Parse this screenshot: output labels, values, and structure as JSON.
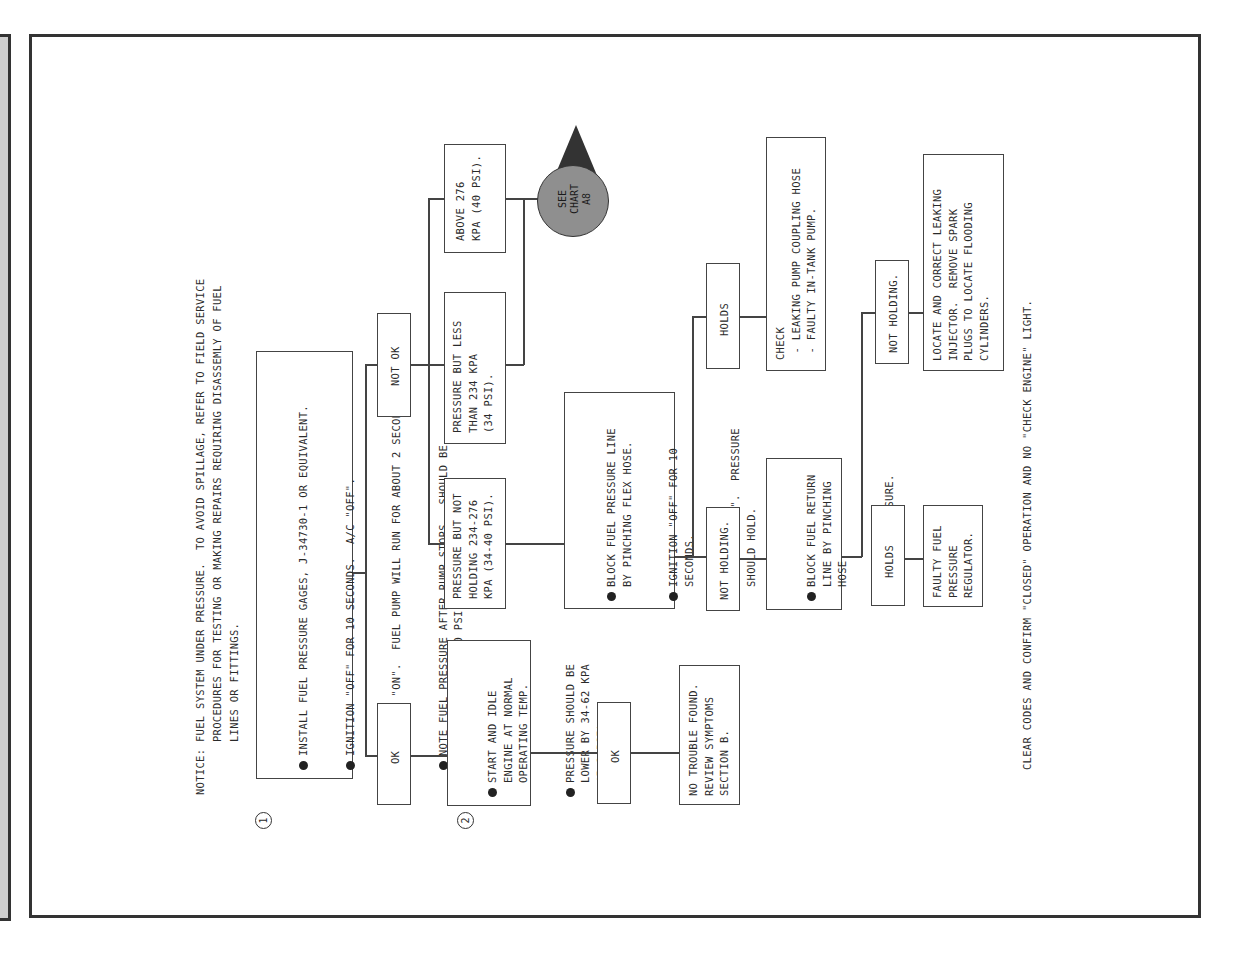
{
  "notice": "NOTICE: FUEL SYSTEM UNDER PRESSURE.  TO AVOID SPILLAGE, REFER TO FIELD SERVICE\n        PROCEDURES FOR TESTING OR MAKING REPAIRS REQUIRING DISASSEMLY OF FUEL\n        LINES OR FITTINGS.",
  "steps": {
    "step1": {
      "number": "1",
      "bullets": [
        "INSTALL FUEL PRESSURE GAGES, J-34730-1 OR EQUIVALENT.",
        "IGNITION \"OFF\" FOR 10 SECONDS.  A/C \"OFF\".",
        "IGNITION \"ON\".  FUEL PUMP WILL RUN FOR ABOUT 2 SECONDS.",
        "NOTE FUEL PRESSURE AFTER PUMP STOPS.  SHOULD BE\n234-276 KPA (34-40 PSI) AND HOLD STEADY."
      ]
    },
    "step2": {
      "number": "2",
      "bullets": [
        "START AND IDLE\nENGINE AT NORMAL\nOPERATING TEMP.",
        "PRESSURE SHOULD BE\nLOWER BY 34-62 KPA\n(5-9 PSI)."
      ]
    }
  },
  "branches": {
    "ok_1": "OK",
    "not_ok": "NOT OK",
    "ok_2": "OK",
    "not_holding_1": "NOT HOLDING.",
    "holds_1": "HOLDS",
    "holds_2": "HOLDS",
    "not_holding_2": "NOT HOLDING."
  },
  "results": {
    "pressure_not_holding": "PRESSURE BUT NOT\nHOLDING 234-276\nKPA (34-40 PSI).",
    "pressure_less": "PRESSURE BUT LESS\nTHAN 234 KPA\n(34 PSI).",
    "above_276": "ABOVE 276\nKPA (40 PSI).",
    "no_trouble": "NO TROUBLE FOUND.\nREVIEW SYMPTOMS\nSECTION B.",
    "block_pressure_line": [
      "BLOCK FUEL PRESSURE LINE\nBY PINCHING FLEX HOSE.",
      "IGNITION \"OFF\" FOR 10\nSECONDS.",
      "IGNITION \"ON\".  PRESSURE\nSHOULD HOLD."
    ],
    "check_pump": "CHECK\n - LEAKING PUMP COUPLING HOSE\n - FAULTY IN-TANK PUMP.",
    "block_return_line": [
      "BLOCK FUEL RETURN\nLINE BY PINCHING\nHOSE.",
      "RECHECK PRESSURE."
    ],
    "faulty_regulator": "FAULTY FUEL\nPRESSURE\nREGULATOR.",
    "leaking_injector": "LOCATE AND CORRECT LEAKING\nINJECTOR.  REMOVE SPARK\nPLUGS TO LOCATE FLOODING\nCYLINDERS."
  },
  "see_chart": "SEE\nCHART\nA8",
  "footer": "CLEAR CODES AND CONFIRM \"CLOSED\" OPERATION AND NO \"CHECK ENGINE\" LIGHT."
}
